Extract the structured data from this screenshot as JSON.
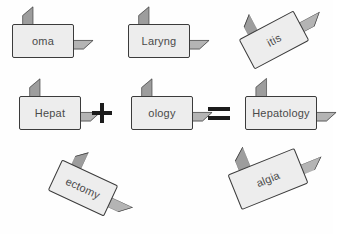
{
  "diagram": {
    "background_color": "#fefefe",
    "block_front_color": "#ededed",
    "block_top_color": "#b4b4b4",
    "block_side_color": "#9d9d9d",
    "block_outline_color": "#3b3b3b",
    "label_color": "#4a4a4a",
    "operator_color": "#1c1c1c"
  },
  "blocks": [
    {
      "id": "oma",
      "label": "oma",
      "row": "top",
      "position": "top-left",
      "rotation_deg": 0,
      "left": 12,
      "top": 24,
      "width": 62,
      "height": 34
    },
    {
      "id": "laryng",
      "label": "Laryng",
      "row": "top",
      "position": "top-center",
      "rotation_deg": 0,
      "left": 128,
      "top": 24,
      "width": 62,
      "height": 34
    },
    {
      "id": "itis",
      "label": "itis",
      "row": "top",
      "position": "top-right",
      "rotation_deg": -28,
      "left": 243,
      "top": 23,
      "width": 62,
      "height": 34
    },
    {
      "id": "hepat",
      "label": "Hepat",
      "row": "middle",
      "position": "equation-term-1",
      "rotation_deg": 0,
      "left": 19,
      "top": 96,
      "width": 62,
      "height": 34
    },
    {
      "id": "ology",
      "label": "ology",
      "row": "middle",
      "position": "equation-term-2",
      "rotation_deg": 0,
      "left": 131,
      "top": 96,
      "width": 62,
      "height": 34
    },
    {
      "id": "hepatology",
      "label": "Hepatology",
      "row": "middle",
      "position": "equation-result",
      "rotation_deg": 0,
      "left": 245,
      "top": 96,
      "width": 72,
      "height": 34
    },
    {
      "id": "ectomy",
      "label": "ectomy",
      "row": "bottom",
      "position": "bottom-left",
      "rotation_deg": 25,
      "left": 52,
      "top": 171,
      "width": 62,
      "height": 34
    },
    {
      "id": "algia",
      "label": "algia",
      "row": "bottom",
      "position": "bottom-right",
      "rotation_deg": -22,
      "left": 232,
      "top": 160,
      "width": 72,
      "height": 38
    }
  ],
  "operators": [
    {
      "id": "plus",
      "symbol": "+",
      "name": "plus",
      "left": 92,
      "top": 103,
      "size": 20
    },
    {
      "id": "equals",
      "symbol": "=",
      "name": "equals",
      "left": 208,
      "top": 107,
      "width": 22,
      "height": 13
    }
  ]
}
